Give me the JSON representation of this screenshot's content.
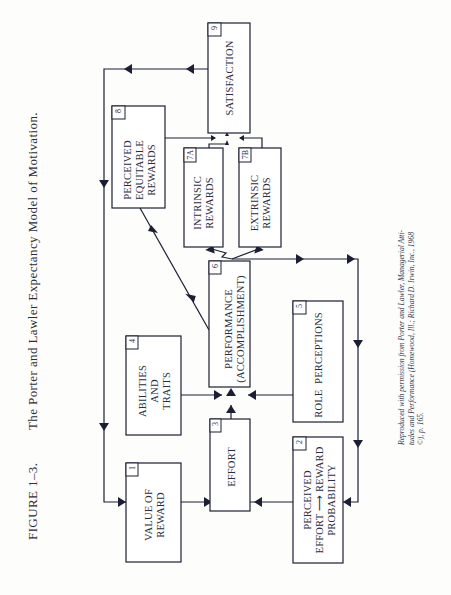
{
  "figure": {
    "number_label": "FIGURE 1–3.",
    "title": "The Porter and Lawler Expectancy Model of Motivation."
  },
  "boxes": {
    "b1": {
      "num": "1",
      "lines": [
        "VALUE OF",
        "REWARD"
      ]
    },
    "b2": {
      "num": "2",
      "lines": [
        "PERCEIVED",
        "EFFORT ⟶ REWARD",
        "PROBABILITY"
      ]
    },
    "b3": {
      "num": "3",
      "lines": [
        "EFFORT"
      ]
    },
    "b4": {
      "num": "4",
      "lines": [
        "ABILITIES",
        "AND",
        "TRAITS"
      ]
    },
    "b5": {
      "num": "5",
      "lines": [
        "ROLE  PERCEPTIONS"
      ]
    },
    "b6": {
      "num": "6",
      "lines": [
        "PERFORMANCE",
        "(ACCOMPLISHMENT)"
      ]
    },
    "b7a": {
      "num": "7A",
      "lines": [
        "INTRINSIC",
        "REWARDS"
      ]
    },
    "b7b": {
      "num": "7B",
      "lines": [
        "EXTRINSIC",
        "REWARDS"
      ]
    },
    "b8": {
      "num": "8",
      "lines": [
        "PERCEIVED",
        "EQUITABLE",
        "REWARDS"
      ]
    },
    "b9": {
      "num": "9",
      "lines": [
        "SATISFACTION"
      ]
    }
  },
  "source_note": {
    "line1": "Reproduced with permission from Porter and Lawler, Managerial Atti-",
    "line2": "tudes and Performance (Homewood, Ill.; Richard D. Irwin, Inc., 1968",
    "line3": "©), p. 165."
  },
  "colors": {
    "ink": "#1c1f33",
    "paper": "#fdfdfb"
  }
}
